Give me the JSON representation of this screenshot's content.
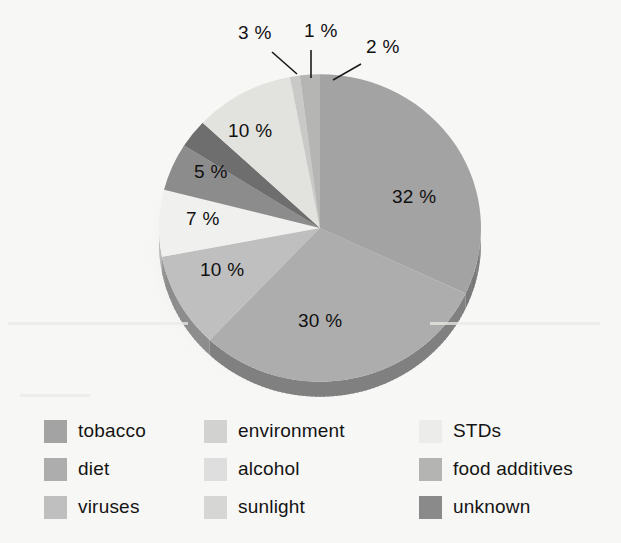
{
  "background_color": "#f7f7f5",
  "chart_data": {
    "type": "pie",
    "title": "",
    "unit": "%",
    "legend_position": "bottom",
    "center": {
      "x": 320,
      "y": 228
    },
    "radius": 161,
    "start_angle_deg": 0,
    "direction": "clockwise",
    "total": 100,
    "categories": [
      "tobacco",
      "diet",
      "viruses",
      "alcohol",
      "environment",
      "unknown",
      "STDs",
      "food additives",
      "sunlight"
    ],
    "values": [
      32,
      30,
      10,
      7,
      5,
      3,
      10,
      1,
      2
    ],
    "slices": [
      {
        "label": "tobacco",
        "value": 32,
        "display": "32 %",
        "color": "#a3a3a3",
        "label_x": 392,
        "label_y": 186,
        "label_style": "inside"
      },
      {
        "label": "diet",
        "value": 30,
        "display": "30 %",
        "color": "#adadad",
        "label_x": 298,
        "label_y": 310,
        "label_style": "inside"
      },
      {
        "label": "viruses",
        "value": 10,
        "display": "10 %",
        "color": "#bfbfbf",
        "label_x": 200,
        "label_y": 259,
        "label_style": "inside"
      },
      {
        "label": "alcohol",
        "value": 7,
        "display": "7 %",
        "color": "#f0f0ee",
        "label_x": 186,
        "label_y": 208,
        "label_style": "inside"
      },
      {
        "label": "environment",
        "value": 5,
        "display": "5 %",
        "color": "#8c8c8c",
        "label_x": 194,
        "label_y": 161,
        "label_style": "inside"
      },
      {
        "label": "unknown",
        "value": 3,
        "display": "3 %",
        "color": "#6e6e6e",
        "label_x": 238,
        "label_y": 22,
        "label_style": "callout"
      },
      {
        "label": "STDs",
        "value": 10,
        "display": "10 %",
        "color": "#e2e2de",
        "label_x": 228,
        "label_y": 120,
        "label_style": "inside"
      },
      {
        "label": "food additives",
        "value": 1,
        "display": "1 %",
        "color": "#c9c9c7",
        "label_x": 304,
        "label_y": 20,
        "label_style": "callout"
      },
      {
        "label": "sunlight",
        "value": 2,
        "display": "2 %",
        "color": "#b5b5b3",
        "label_x": 366,
        "label_y": 36,
        "label_style": "callout"
      }
    ]
  },
  "callouts": [
    {
      "name": "callout-3pct",
      "text": "3 %",
      "x": 238,
      "y": 22,
      "line": {
        "x1": 272,
        "y1": 52,
        "x2": 297,
        "y2": 74
      }
    },
    {
      "name": "callout-1pct",
      "text": "1 %",
      "x": 304,
      "y": 20,
      "line": {
        "x1": 311,
        "y1": 50,
        "x2": 311,
        "y2": 78
      }
    },
    {
      "name": "callout-2pct",
      "text": "2 %",
      "x": 366,
      "y": 36,
      "line": {
        "x1": 361,
        "y1": 64,
        "x2": 333,
        "y2": 80
      }
    }
  ],
  "legend": {
    "columns": 3,
    "items": [
      {
        "label": "tobacco",
        "color": "#a3a3a3",
        "column": 1,
        "row": 1
      },
      {
        "label": "diet",
        "color": "#adadad",
        "column": 1,
        "row": 2
      },
      {
        "label": "viruses",
        "color": "#bfbfbf",
        "column": 1,
        "row": 3
      },
      {
        "label": "environment",
        "color": "#d2d2d0",
        "column": 2,
        "row": 1
      },
      {
        "label": "alcohol",
        "color": "#dedede",
        "column": 2,
        "row": 2
      },
      {
        "label": "sunlight",
        "color": "#d6d6d4",
        "column": 2,
        "row": 3
      },
      {
        "label": "STDs",
        "color": "#ececea",
        "column": 3,
        "row": 1
      },
      {
        "label": "food additives",
        "color": "#b4b4b2",
        "column": 3,
        "row": 2
      },
      {
        "label": "unknown",
        "color": "#8a8a8a",
        "column": 3,
        "row": 3
      }
    ]
  }
}
